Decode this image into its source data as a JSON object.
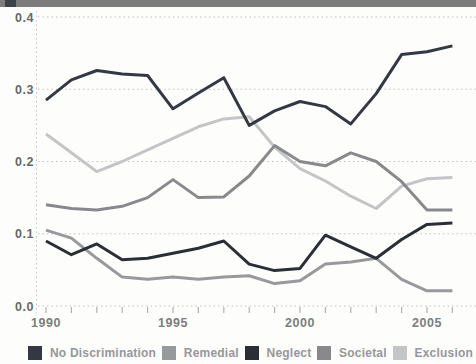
{
  "chart_data": {
    "type": "line",
    "title": "",
    "xlabel": "",
    "ylabel": "",
    "x": [
      1990,
      1991,
      1992,
      1993,
      1994,
      1995,
      1996,
      1997,
      1998,
      1999,
      2000,
      2001,
      2002,
      2003,
      2004,
      2005,
      2006
    ],
    "series": [
      {
        "name": "No Discrimination",
        "color": "#333842",
        "values": [
          0.285,
          0.313,
          0.326,
          0.321,
          0.319,
          0.273,
          0.295,
          0.316,
          0.25,
          0.27,
          0.283,
          0.276,
          0.252,
          0.294,
          0.348,
          0.352,
          0.36
        ]
      },
      {
        "name": "Remedial",
        "color": "#97999c",
        "values": [
          0.105,
          0.094,
          0.066,
          0.04,
          0.037,
          0.04,
          0.037,
          0.04,
          0.042,
          0.031,
          0.035,
          0.058,
          0.061,
          0.066,
          0.037,
          0.021,
          0.021
        ]
      },
      {
        "name": "Neglect",
        "color": "#2b2e35",
        "values": [
          0.09,
          0.071,
          0.086,
          0.064,
          0.066,
          0.073,
          0.08,
          0.09,
          0.058,
          0.049,
          0.052,
          0.098,
          0.082,
          0.066,
          0.092,
          0.113,
          0.115
        ]
      },
      {
        "name": "Societal",
        "color": "#87898c",
        "values": [
          0.14,
          0.135,
          0.133,
          0.138,
          0.15,
          0.175,
          0.15,
          0.151,
          0.18,
          0.222,
          0.2,
          0.194,
          0.212,
          0.2,
          0.172,
          0.133,
          0.133
        ]
      },
      {
        "name": "Exclusion",
        "color": "#c4c5c7",
        "values": [
          0.238,
          0.212,
          0.186,
          0.2,
          0.216,
          0.232,
          0.248,
          0.259,
          0.262,
          0.22,
          0.19,
          0.173,
          0.152,
          0.135,
          0.166,
          0.176,
          0.178
        ]
      }
    ],
    "yticks": [
      0.0,
      0.1,
      0.2,
      0.3,
      0.4
    ],
    "xticks": [
      1990,
      1995,
      2000,
      2005
    ],
    "ylim": [
      0.0,
      0.4
    ],
    "grid": "horizontal-dotted",
    "legend_position": "bottom"
  },
  "style": {
    "grid_color": "#c3c3c3",
    "tick_color": "#b2b2b2",
    "ytick_label_color": "#67696c",
    "xtick_label_color": "#7b7d80",
    "legend_label_color": "#95979a",
    "topbar_color": "#7c7c7c",
    "topbar_chip_color": "#3e4145",
    "background": "#fdfdfc"
  }
}
